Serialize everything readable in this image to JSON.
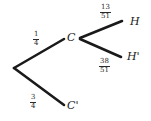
{
  "diagram": {
    "type": "probability-tree",
    "background_color": "#ffffff",
    "stroke_color": "#1a1a1a",
    "nodes": [
      {
        "id": "root",
        "label": "",
        "x": 14,
        "y": 68
      },
      {
        "id": "c",
        "label": "C",
        "x": 68,
        "y": 38
      },
      {
        "id": "cprime",
        "label": "C'",
        "x": 68,
        "y": 106
      },
      {
        "id": "h",
        "label": "H",
        "x": 130,
        "y": 22
      },
      {
        "id": "hprime",
        "label": "H'",
        "x": 128,
        "y": 58
      }
    ],
    "branches": [
      {
        "id": "root-to-c",
        "from": "root",
        "to": "c",
        "numerator": "1",
        "denominator": "4"
      },
      {
        "id": "root-to-cprime",
        "from": "root",
        "to": "cprime",
        "numerator": "3",
        "denominator": "4"
      },
      {
        "id": "c-to-h",
        "from": "c",
        "to": "h",
        "numerator": "13",
        "denominator": "51"
      },
      {
        "id": "c-to-hprime",
        "from": "c",
        "to": "hprime",
        "numerator": "38",
        "denominator": "51"
      }
    ]
  }
}
